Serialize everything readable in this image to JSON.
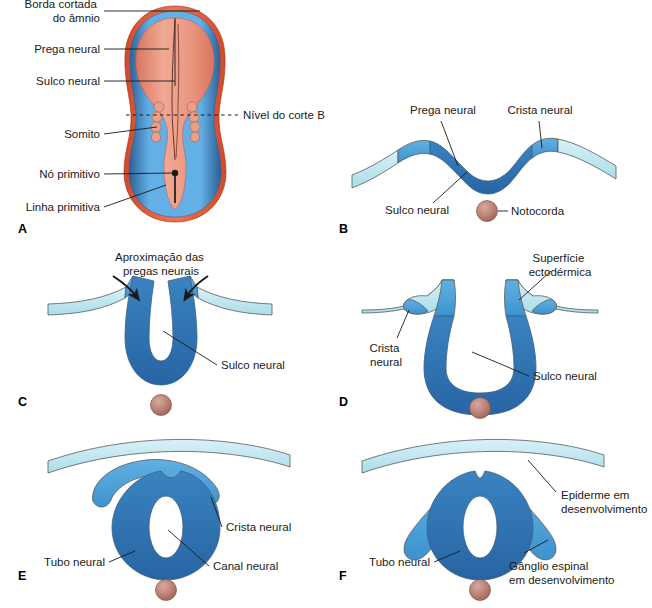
{
  "figure": {
    "background_color": "#ffffff",
    "palette": {
      "ectoderm_light": "#c8eaf2",
      "neural_crest_medium": "#4a9fd8",
      "neural_plate_dark": "#2b74b8",
      "neural_groove_darkest": "#2f6fae",
      "notochord_fill": "#b5786e",
      "notochord_highlight": "#d8a79c",
      "embryo_amnion_blue": "#5aa8e0",
      "embryo_disc_salmon": "#e8907c",
      "embryo_rim_orange": "#e05a3a",
      "leader_line": "#1a1a1a",
      "outline": "#5a5a5a"
    }
  },
  "panels": [
    {
      "id": "A",
      "letter": "A",
      "letter_x": 18,
      "letter_y": 233,
      "labels": [
        {
          "id": "borda-cortada-do-amnio",
          "lines": [
            "Borda cortada",
            "do âmnio"
          ],
          "x": 100,
          "y": 14,
          "anchor": "end"
        },
        {
          "id": "prega-neural",
          "lines": [
            "Prega neural"
          ],
          "x": 100,
          "y": 52,
          "anchor": "end"
        },
        {
          "id": "sulco-neural",
          "lines": [
            "Sulco neural"
          ],
          "x": 100,
          "y": 84,
          "anchor": "end"
        },
        {
          "id": "nivel-do-corte-b",
          "lines": [
            "Nível do corte B"
          ],
          "x": 243,
          "y": 117,
          "anchor": "start"
        },
        {
          "id": "somito",
          "lines": [
            "Somito"
          ],
          "x": 100,
          "y": 137,
          "anchor": "end"
        },
        {
          "id": "no-primitivo",
          "lines": [
            "Nó primitivo"
          ],
          "x": 100,
          "y": 177,
          "anchor": "end"
        },
        {
          "id": "linha-primitiva",
          "lines": [
            "Linha primitiva"
          ],
          "x": 100,
          "y": 210,
          "anchor": "end"
        }
      ]
    },
    {
      "id": "B",
      "letter": "B",
      "letter_x": 339,
      "letter_y": 233,
      "labels": [
        {
          "id": "prega-neural",
          "lines": [
            "Prega neural"
          ],
          "x": 443,
          "y": 113,
          "anchor": "middle"
        },
        {
          "id": "crista-neural",
          "lines": [
            "Crista neural"
          ],
          "x": 538,
          "y": 113,
          "anchor": "middle"
        },
        {
          "id": "sulco-neural",
          "lines": [
            "Sulco neural"
          ],
          "x": 420,
          "y": 212,
          "anchor": "middle"
        },
        {
          "id": "notocorda",
          "lines": [
            "Notocorda"
          ],
          "x": 511,
          "y": 216,
          "anchor": "start"
        }
      ]
    },
    {
      "id": "C",
      "letter": "C",
      "letter_x": 18,
      "letter_y": 406,
      "labels": [
        {
          "id": "aproximacao-das-pregas-neurais",
          "lines": [
            "Aproximação das",
            "pregas neurais"
          ],
          "x": 160,
          "y": 258,
          "anchor": "middle"
        },
        {
          "id": "sulco-neural",
          "lines": [
            "Sulco neural"
          ],
          "x": 221,
          "y": 368,
          "anchor": "start"
        }
      ]
    },
    {
      "id": "D",
      "letter": "D",
      "letter_x": 339,
      "letter_y": 406,
      "labels": [
        {
          "id": "superficie-ectodermica",
          "lines": [
            "Superfície",
            "ectodérmica"
          ],
          "x": 557,
          "y": 259,
          "anchor": "middle"
        },
        {
          "id": "crista-neural",
          "lines": [
            "Crista",
            "neural"
          ],
          "x": 388,
          "y": 350,
          "anchor": "middle"
        },
        {
          "id": "sulco-neural",
          "lines": [
            "Sulco neural"
          ],
          "x": 533,
          "y": 379,
          "anchor": "start"
        }
      ]
    },
    {
      "id": "E",
      "letter": "E",
      "letter_x": 18,
      "letter_y": 580,
      "labels": [
        {
          "id": "crista-neural",
          "lines": [
            "Crista neural"
          ],
          "x": 226,
          "y": 531,
          "anchor": "start"
        },
        {
          "id": "tubo-neural",
          "lines": [
            "Tubo neural"
          ],
          "x": 105,
          "y": 566,
          "anchor": "end"
        },
        {
          "id": "canal-neural",
          "lines": [
            "Canal neural"
          ],
          "x": 213,
          "y": 570,
          "anchor": "start"
        }
      ]
    },
    {
      "id": "F",
      "letter": "F",
      "letter_x": 339,
      "letter_y": 580,
      "labels": [
        {
          "id": "epiderme-em-desenvolvimento",
          "lines": [
            "Epiderme em",
            "desenvolvimento"
          ],
          "x": 561,
          "y": 499,
          "anchor": "start"
        },
        {
          "id": "tubo-neural",
          "lines": [
            "Tubo neural"
          ],
          "x": 430,
          "y": 566,
          "anchor": "end"
        },
        {
          "id": "ganglio-espinal-em-desenvolvimento",
          "lines": [
            "Gânglio espinal",
            "em desenvolvimento"
          ],
          "x": 509,
          "y": 566,
          "anchor": "start"
        }
      ]
    }
  ]
}
